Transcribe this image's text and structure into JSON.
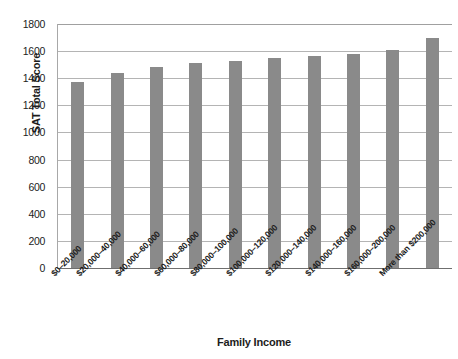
{
  "chart_data": {
    "type": "bar",
    "title": "",
    "xlabel": "Family Income",
    "ylabel": "SAT Total Score",
    "categories": [
      "$0–20,000",
      "$20,000–40,000",
      "$40,000–60,000",
      "$60,000–80,000",
      "$80,000–100,000",
      "$100,000–120,000",
      "$120,000–140,000",
      "$140,000–160,000",
      "$160,000–200,000",
      "More than $200,000"
    ],
    "values": [
      1370,
      1440,
      1480,
      1510,
      1525,
      1550,
      1565,
      1580,
      1610,
      1700
    ],
    "ylim": [
      0,
      1800
    ],
    "ytick_step": 200,
    "yticks": [
      "1800",
      "1600",
      "1400",
      "1200",
      "1000",
      "800",
      "600",
      "400",
      "200",
      "0"
    ],
    "ytick_values": [
      1800,
      1600,
      1400,
      1200,
      1000,
      800,
      600,
      400,
      200,
      0
    ],
    "grid": true,
    "legend": false,
    "bar_color": "#8a8a8a",
    "gridline_color": "#b4b4b4",
    "axis_color": "#6f6f6f",
    "text_color": "#1c1c1c",
    "background": "#ffffff"
  }
}
